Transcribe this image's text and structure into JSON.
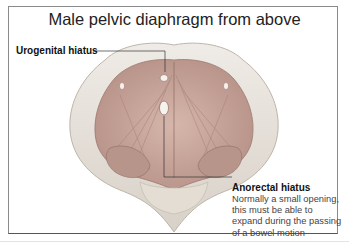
{
  "diagram": {
    "title": "Male pelvic diaphragm from above",
    "labels": {
      "urogenital": "Urogenital hiatus",
      "anorectal": "Anorectal hiatus",
      "anorectal_desc": [
        "Normally a small opening,",
        "this must be able to",
        "expand during the passing",
        "of a bowel motion"
      ]
    },
    "colors": {
      "muscle": "#c9a89e",
      "muscle_dark": "#a9837a",
      "bone": "#e6e1da",
      "bone_shadow": "#c9c2b8",
      "border": "#8a8a8a",
      "leader_line": "#333333"
    }
  }
}
